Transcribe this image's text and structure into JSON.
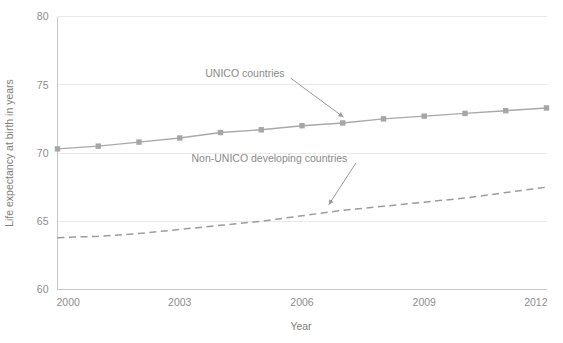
{
  "chart_data": {
    "type": "line",
    "title": "",
    "xlabel": "Year",
    "ylabel": "Life expectancy at birth in years",
    "xlim": [
      2000,
      2012
    ],
    "ylim": [
      60,
      80
    ],
    "xticks": [
      2000,
      2003,
      2006,
      2009,
      2012
    ],
    "xtick_labels": [
      "2000",
      "2003",
      "2006",
      "2009",
      "2012"
    ],
    "yticks": [
      60,
      65,
      70,
      75,
      80
    ],
    "ytick_labels": [
      "60",
      "65",
      "70",
      "75",
      "80"
    ],
    "grid": "horizontal",
    "legend_position": "inline-annotations",
    "x": [
      2000,
      2001,
      2002,
      2003,
      2004,
      2005,
      2006,
      2007,
      2008,
      2009,
      2010,
      2011,
      2012
    ],
    "series": [
      {
        "name": "UNICO countries",
        "style": "solid",
        "marker": "square",
        "color": "#a6a6a6",
        "values": [
          70.3,
          70.5,
          70.8,
          71.1,
          71.5,
          71.7,
          72.0,
          72.2,
          72.5,
          72.7,
          72.9,
          73.1,
          73.3
        ]
      },
      {
        "name": "Non-UNICO developing countries",
        "style": "dashed",
        "marker": "none",
        "color": "#9c9c9c",
        "values": [
          63.8,
          63.9,
          64.1,
          64.4,
          64.7,
          65.0,
          65.4,
          65.8,
          66.1,
          66.4,
          66.7,
          67.1,
          67.5
        ]
      }
    ],
    "annotations": [
      {
        "text": "UNICO countries",
        "label_x": 2004.6,
        "label_y": 75.55,
        "target_x": 2007.1,
        "target_y": 72.45
      },
      {
        "text": "Non-UNICO developing countries",
        "label_x": 2005.2,
        "label_y": 69.35,
        "target_x": 2006.6,
        "target_y": 65.95
      }
    ]
  },
  "colors": {
    "background": "#ffffff",
    "grid": "#e9e9e9",
    "axis": "#c9c9c9",
    "text": "#8a8a8a",
    "series_unico": "#a6a6a6",
    "series_non_unico": "#9c9c9c"
  }
}
